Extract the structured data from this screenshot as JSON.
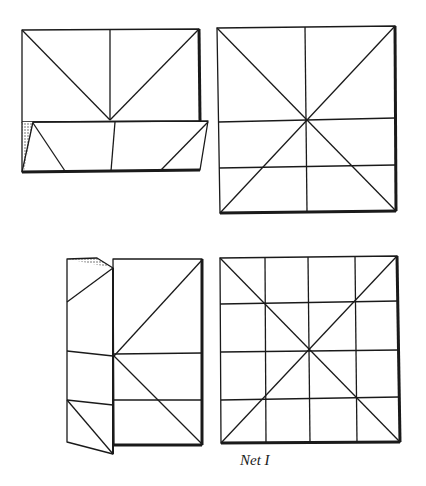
{
  "figure": {
    "caption": "Net I",
    "stroke_color": "#1a1a1a",
    "shade_color": "#555555",
    "panels": [
      {
        "id": "panel-1",
        "label": "folded rectangle with bottom flap"
      },
      {
        "id": "panel-2",
        "label": "unfolded square with diagonals and crease lines"
      },
      {
        "id": "panel-3",
        "label": "folded rectangle with left flap"
      },
      {
        "id": "panel-4",
        "label": "final square net with 4x4 grid and diagonals"
      }
    ]
  }
}
